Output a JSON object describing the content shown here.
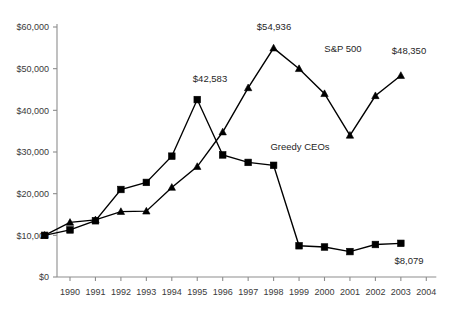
{
  "chart_data": {
    "type": "line",
    "title": "",
    "subtitle": "",
    "xlabel": "",
    "ylabel": "",
    "xlim": [
      1989,
      2004
    ],
    "ylim": [
      0,
      60000
    ],
    "grid": false,
    "legend_position": "inline-annotation",
    "x": [
      1989,
      1990,
      1991,
      1992,
      1993,
      1994,
      1995,
      1996,
      1997,
      1998,
      1999,
      2000,
      2001,
      2002,
      2003
    ],
    "xtick_labels": [
      "1990",
      "1991",
      "1992",
      "1993",
      "1994",
      "1995",
      "1996",
      "1997",
      "1998",
      "1999",
      "2000",
      "2001",
      "2002",
      "2003",
      "2004"
    ],
    "xtick_values": [
      1990,
      1991,
      1992,
      1993,
      1994,
      1995,
      1996,
      1997,
      1998,
      1999,
      2000,
      2001,
      2002,
      2003,
      2004
    ],
    "ytick_labels": [
      "$0",
      "$10,000",
      "$20,000",
      "$30,000",
      "$40,000",
      "$50,000",
      "$60,000"
    ],
    "ytick_values": [
      0,
      10000,
      20000,
      30000,
      40000,
      50000,
      60000
    ],
    "series": [
      {
        "name": "Greedy CEOs",
        "marker": "square",
        "color": "#000000",
        "values": [
          10000,
          11300,
          13500,
          21000,
          22700,
          29000,
          42583,
          29300,
          27500,
          26800,
          7500,
          7200,
          6100,
          7800,
          8079
        ]
      },
      {
        "name": "S&P 500",
        "marker": "triangle",
        "color": "#000000",
        "values": [
          10000,
          13100,
          13700,
          15700,
          15800,
          21500,
          26500,
          34800,
          45400,
          54936,
          50000,
          44000,
          34000,
          43500,
          48350
        ]
      }
    ],
    "annotations": [
      {
        "text": "$42,583",
        "series": "Greedy CEOs",
        "x": 1995,
        "y": 42583,
        "px": 210,
        "py": 82
      },
      {
        "text": "$54,936",
        "series": "S&P 500",
        "x": 1998,
        "y": 54936,
        "px": 274,
        "py": 30
      },
      {
        "text": "$48,350",
        "series": "S&P 500",
        "x": 2003,
        "y": 48350,
        "px": 409,
        "py": 54
      },
      {
        "text": "$8,079",
        "series": "Greedy CEOs",
        "x": 2003,
        "y": 8079,
        "px": 409,
        "py": 264
      },
      {
        "text": "S&P 500",
        "series": "S&P 500",
        "x": 1999,
        "y": 50000,
        "px": 343,
        "py": 52
      },
      {
        "text": "Greedy CEOs",
        "series": "Greedy CEOs",
        "x": 1997,
        "y": 27500,
        "px": 300,
        "py": 150
      }
    ]
  }
}
